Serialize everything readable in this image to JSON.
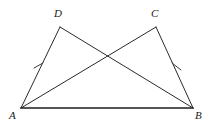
{
  "figure": {
    "background_color": "#ffffff",
    "line_color": "#2b2b2b",
    "base_line_color": "#1e1e1e",
    "tick_color": "#3a3a3a",
    "width": 211,
    "height": 124,
    "points": {
      "A": {
        "label": "A",
        "x": 21,
        "y": 108,
        "label_x": 9,
        "label_y": 110
      },
      "B": {
        "label": "B",
        "x": 193,
        "y": 108,
        "label_x": 195,
        "label_y": 110
      },
      "C": {
        "label": "C",
        "x": 156,
        "y": 27,
        "label_x": 151,
        "label_y": 8
      },
      "D": {
        "label": "D",
        "x": 60,
        "y": 27,
        "label_x": 54,
        "label_y": 8
      }
    },
    "segments": [
      {
        "name": "segment-AB",
        "from": "A",
        "to": "B",
        "x1": 21,
        "y1": 108,
        "x2": 193,
        "y2": 108,
        "style": "base"
      },
      {
        "name": "segment-AD",
        "from": "A",
        "to": "D",
        "x1": 21,
        "y1": 108,
        "x2": 60,
        "y2": 27,
        "style": "normal"
      },
      {
        "name": "segment-BC",
        "from": "B",
        "to": "C",
        "x1": 193,
        "y1": 108,
        "x2": 156,
        "y2": 27,
        "style": "normal"
      },
      {
        "name": "segment-DC",
        "from": "D",
        "to": "C",
        "x1": 60,
        "y1": 27,
        "x2": 156,
        "y2": 27,
        "style": "none"
      },
      {
        "name": "segment-AC",
        "from": "A",
        "to": "C",
        "x1": 21,
        "y1": 108,
        "x2": 156,
        "y2": 27,
        "style": "normal"
      },
      {
        "name": "segment-BD",
        "from": "B",
        "to": "D",
        "x1": 193,
        "y1": 108,
        "x2": 60,
        "y2": 27,
        "style": "normal"
      }
    ],
    "tick_marks": [
      {
        "name": "tick-mark-AD",
        "on_segment": "segment-AD",
        "x1": 34,
        "y1": 68,
        "x2": 43,
        "y2": 63
      },
      {
        "name": "tick-mark-BC",
        "on_segment": "segment-BC",
        "x1": 172,
        "y1": 63,
        "x2": 181,
        "y2": 70
      }
    ],
    "intersection": {
      "name": "diagonal-intersection",
      "x": 108,
      "y": 53
    }
  }
}
